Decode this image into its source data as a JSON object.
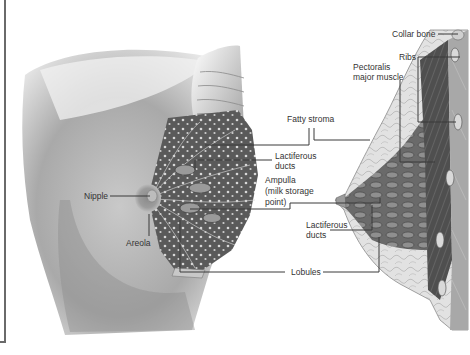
{
  "diagram": {
    "views": [
      "front-cutaway",
      "side-cross-section"
    ],
    "labels": {
      "collar_bone": "Collar bone",
      "ribs": "Ribs",
      "pectoralis_line1": "Pectoralis",
      "pectoralis_line2": "major muscle",
      "fatty_stroma": "Fatty stroma",
      "lactiferous_ducts_upper_line1": "Lactiferous",
      "lactiferous_ducts_upper_line2": "ducts",
      "ampulla_line1": "Ampulla",
      "ampulla_line2": "(milk storage",
      "ampulla_line3": "point)",
      "nipple": "Nipple",
      "areola": "Areola",
      "lactiferous_ducts_lower_line1": "Lactiferous",
      "lactiferous_ducts_lower_line2": "ducts",
      "lobules": "Lobules"
    },
    "colors": {
      "background": "#ffffff",
      "leader_line": "#3a3a3a",
      "label_text": "#333333",
      "skin_shade": "#b8b8b8",
      "tissue_dark": "#5e5e5e",
      "frame": "#6a6a6a"
    }
  }
}
